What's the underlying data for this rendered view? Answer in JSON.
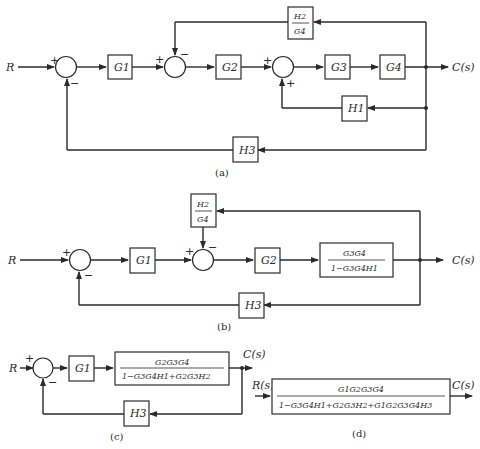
{
  "diagrams": {
    "a": {
      "caption": "(a)",
      "input": "R",
      "output": "C(s)",
      "blocks": {
        "g1": "G1",
        "g2": "G2",
        "g3": "G3",
        "g4": "G4",
        "h1": "H1",
        "h3": "H3",
        "h2g4_num": "H2",
        "h2g4_den": "G4"
      },
      "signs": {
        "s1_in": "+",
        "s1_fb": "−",
        "s2_in": "+",
        "s2_fb": "−",
        "s3_in": "+",
        "s3_fb": "+"
      }
    },
    "b": {
      "caption": "(b)",
      "input": "R",
      "output": "C(s)",
      "blocks": {
        "g1": "G1",
        "g2": "G2",
        "h3": "H3",
        "h2g4_num": "H2",
        "h2g4_den": "G4",
        "tf_num": "G3G4",
        "tf_den": "1−G3G4H1"
      },
      "signs": {
        "s1_in": "+",
        "s1_fb": "−",
        "s2_in": "+",
        "s2_fb": "−"
      }
    },
    "c": {
      "caption": "(c)",
      "input": "R",
      "output": "C(s)",
      "blocks": {
        "g1": "G1",
        "h3": "H3",
        "tf_num": "G2G3G4",
        "tf_den": "1−G3G4H1+G2G3H2"
      },
      "signs": {
        "s1_in": "+",
        "s1_fb": "−"
      }
    },
    "d": {
      "caption": "(d)",
      "input": "R(s)",
      "output": "C(s)",
      "blocks": {
        "tf_num": "G1G2G3G4",
        "tf_den": "1−G3G4H1+G2G3H2+G1G2G3G4H3"
      }
    }
  }
}
